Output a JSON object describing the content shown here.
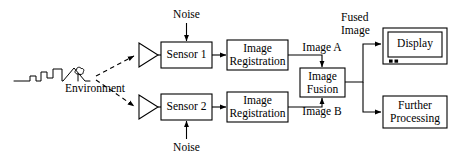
{
  "diagram": {
    "type": "block-flow-diagram",
    "stroke_color": "#000000",
    "background_color": "#ffffff",
    "nodes": {
      "environment": {
        "label": "Environment",
        "shape": "skyline-sketch"
      },
      "amplifier_1": {
        "label": "",
        "shape": "triangle"
      },
      "amplifier_2": {
        "label": "",
        "shape": "triangle"
      },
      "sensor_1": {
        "label": "Sensor 1",
        "shape": "rectangle"
      },
      "sensor_2": {
        "label": "Sensor 2",
        "shape": "rectangle"
      },
      "noise_top": {
        "label": "Noise",
        "shape": "text"
      },
      "noise_bottom": {
        "label": "Noise",
        "shape": "text"
      },
      "registration_1": {
        "line1": "Image",
        "line2": "Registration",
        "shape": "rectangle"
      },
      "registration_2": {
        "line1": "Image",
        "line2": "Registration",
        "shape": "rectangle"
      },
      "fusion": {
        "line1": "Image",
        "line2": "Fusion",
        "shape": "rectangle"
      },
      "display": {
        "label": "Display",
        "shape": "monitor"
      },
      "further_processing": {
        "line1": "Further",
        "line2": "Processing",
        "shape": "rectangle"
      }
    },
    "edge_labels": {
      "image_a": "Image A",
      "image_b": "Image B",
      "fused_line1": "Fused",
      "fused_line2": "Image"
    },
    "edges": [
      {
        "from": "environment",
        "to": "amplifier_1",
        "style": "dashed",
        "arrow": true
      },
      {
        "from": "environment",
        "to": "amplifier_2",
        "style": "dashed",
        "arrow": true
      },
      {
        "from": "amplifier_1",
        "to": "sensor_1",
        "style": "solid",
        "arrow": true
      },
      {
        "from": "amplifier_2",
        "to": "sensor_2",
        "style": "solid",
        "arrow": true
      },
      {
        "from": "noise_top",
        "to": "sensor_1",
        "style": "solid",
        "arrow": true
      },
      {
        "from": "noise_bottom",
        "to": "sensor_2",
        "style": "solid",
        "arrow": true
      },
      {
        "from": "sensor_1",
        "to": "registration_1",
        "style": "solid",
        "arrow": true
      },
      {
        "from": "sensor_2",
        "to": "registration_2",
        "style": "solid",
        "arrow": true
      },
      {
        "from": "registration_1",
        "to": "fusion",
        "style": "solid",
        "arrow": true,
        "label": "Image A"
      },
      {
        "from": "registration_2",
        "to": "fusion",
        "style": "solid",
        "arrow": true,
        "label": "Image B"
      },
      {
        "from": "fusion",
        "to": "display",
        "style": "solid",
        "arrow": true,
        "label": "Fused Image"
      },
      {
        "from": "fusion",
        "to": "further_processing",
        "style": "solid",
        "arrow": true
      }
    ]
  }
}
